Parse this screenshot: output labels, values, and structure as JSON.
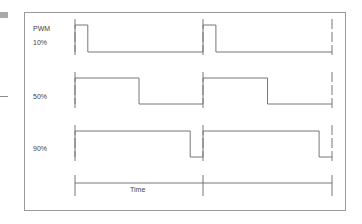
{
  "diagram": {
    "title_label": "PWM",
    "axis_label": "Time",
    "colors": {
      "frame": "#9a9a9a",
      "wave": "#777777",
      "text": "#444444",
      "side": "#a9a9a9"
    },
    "frame": {
      "x": 24,
      "y": 12,
      "w": 321,
      "h": 198
    },
    "period_x": [
      75,
      203,
      332
    ],
    "rows": [
      {
        "label": "10%",
        "duty": 0.1,
        "high_y": 25,
        "low_y": 52,
        "label_y": 45
      },
      {
        "label": "50%",
        "duty": 0.5,
        "high_y": 78,
        "low_y": 104,
        "label_y": 99
      },
      {
        "label": "90%",
        "duty": 0.9,
        "high_y": 131,
        "low_y": 157,
        "label_y": 151
      }
    ],
    "time_axis": {
      "y": 183,
      "tick_top": 175,
      "tick_bottom": 196,
      "label_x": 140,
      "label_y": 192
    }
  }
}
